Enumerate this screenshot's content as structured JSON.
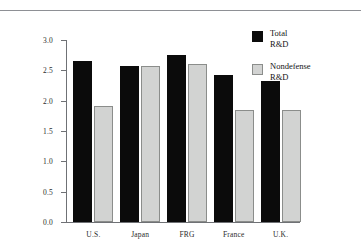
{
  "page": {
    "background_color": "#ffffff",
    "rule_color": "#8e9095"
  },
  "chart_data": {
    "type": "bar",
    "title": "",
    "subtitle": "",
    "xlabel": "",
    "ylabel": "",
    "categories": [
      "U.S.",
      "Japan",
      "FRG",
      "France",
      "U.K."
    ],
    "series": [
      {
        "name": "Total R&D",
        "color": "#0b0b0b",
        "values": [
          2.65,
          2.57,
          2.75,
          2.42,
          2.32
        ]
      },
      {
        "name": "Nondefense R&D",
        "color": "#d2d3d2",
        "values": [
          1.92,
          2.57,
          2.6,
          1.84,
          1.84
        ]
      }
    ],
    "ylim": [
      0.0,
      3.0
    ],
    "ytick_values": [
      0.0,
      0.5,
      1.0,
      1.5,
      2.0,
      2.5,
      3.0
    ],
    "ytick_labels": [
      "0.0",
      "0.5",
      "1.0",
      "1.5",
      "2.0",
      "2.5",
      "3.0"
    ],
    "grid": false,
    "legend_position": "right",
    "axis_color": "#6f7175"
  },
  "legend": {
    "entries": [
      {
        "line1": "Total",
        "line2": "R&D",
        "swatch": "total"
      },
      {
        "line1": "Nondefense",
        "line2": "R&D",
        "swatch": "nondefense"
      }
    ]
  }
}
